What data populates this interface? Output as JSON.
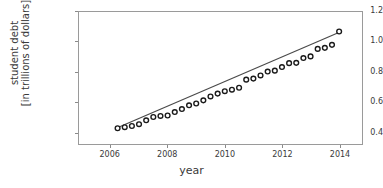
{
  "chart_data": {
    "type": "scatter",
    "title": "",
    "xlabel": "year",
    "ylabel": "student debt\n[in trillions of dollars]",
    "ylabel_line1": "student debt",
    "ylabel_line2": "[in trillions of dollars]",
    "xlim": [
      2004.9,
      2014.8
    ],
    "ylim": [
      0.32,
      1.2
    ],
    "xticks": [
      2006,
      2008,
      2010,
      2012,
      2014
    ],
    "xtick_labels": [
      "2006",
      "2008",
      "2010",
      "2012",
      "2014"
    ],
    "yticks": [
      0.4,
      0.6,
      0.8,
      1.0,
      1.2
    ],
    "ytick_labels": [
      "0.4",
      "0.6",
      "0.8",
      "1.0",
      "1.2"
    ],
    "grid": false,
    "legend": null,
    "marker": "open-circle",
    "marker_color": "#1a1a1a",
    "marker_face": "#ffffff",
    "line_color": "#4a4a4a",
    "frame_color": "#9a9a9a",
    "x": [
      2006.25,
      2006.5,
      2006.75,
      2007.0,
      2007.25,
      2007.5,
      2007.75,
      2008.0,
      2008.25,
      2008.5,
      2008.75,
      2009.0,
      2009.25,
      2009.5,
      2009.75,
      2010.0,
      2010.25,
      2010.5,
      2010.75,
      2011.0,
      2011.25,
      2011.5,
      2011.75,
      2012.0,
      2012.25,
      2012.5,
      2012.75,
      2013.0,
      2013.25,
      2013.5,
      2013.75,
      2014.0
    ],
    "values": [
      0.425,
      0.432,
      0.44,
      0.452,
      0.478,
      0.5,
      0.507,
      0.51,
      0.533,
      0.553,
      0.578,
      0.59,
      0.611,
      0.637,
      0.656,
      0.672,
      0.682,
      0.695,
      0.749,
      0.756,
      0.777,
      0.803,
      0.809,
      0.833,
      0.859,
      0.861,
      0.893,
      0.904,
      0.954,
      0.961,
      0.981,
      1.07
    ],
    "trend_line": {
      "x_start": 2006.2,
      "y_start": 0.425,
      "x_end": 2014.05,
      "y_end": 1.068
    }
  }
}
